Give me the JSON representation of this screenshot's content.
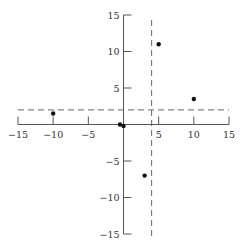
{
  "chart_data": {
    "type": "scatter",
    "title": "",
    "xlabel": "",
    "ylabel": "",
    "xlim": [
      -15,
      15
    ],
    "ylim": [
      -15,
      15
    ],
    "grid": false,
    "legend": null,
    "x_ticks": [
      -15,
      -10,
      -5,
      5,
      10,
      15
    ],
    "x_tick_labels": [
      "−15",
      "−10",
      "−5",
      "5",
      "10",
      "15"
    ],
    "y_ticks": [
      15,
      10,
      5,
      -5,
      -10,
      -15
    ],
    "y_tick_labels": [
      "15",
      "10",
      "5",
      "−5",
      "−10",
      "−15"
    ],
    "series": [
      {
        "name": "points",
        "points": [
          {
            "x": 5,
            "y": 11
          },
          {
            "x": 10,
            "y": 3.5
          },
          {
            "x": -10,
            "y": 1.5
          },
          {
            "x": -0.5,
            "y": 0
          },
          {
            "x": 0,
            "y": -0.2
          },
          {
            "x": 3,
            "y": -7
          }
        ]
      }
    ],
    "reference_lines": [
      {
        "orientation": "vertical",
        "value": 4,
        "style": "dashed"
      },
      {
        "orientation": "horizontal",
        "value": 2,
        "style": "dashed"
      }
    ],
    "colors": {
      "axis": "#555555",
      "points": "#111111",
      "dashed": "#666666"
    }
  }
}
